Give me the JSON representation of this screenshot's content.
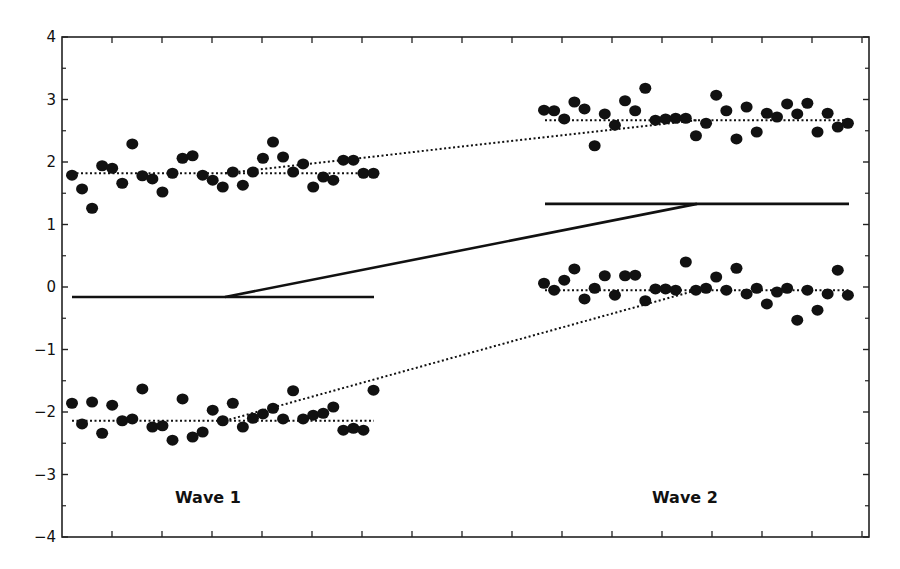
{
  "chart_data": {
    "type": "scatter",
    "title": "",
    "xlabel": "",
    "ylabel": "",
    "ylim": [
      -4,
      4
    ],
    "yticks": [
      4,
      3,
      2,
      1,
      0,
      -1,
      -2,
      -3,
      -4
    ],
    "ytick_labels": [
      "4",
      "3",
      "2",
      "1",
      "0",
      "−1",
      "−2",
      "−3",
      "−4"
    ],
    "grid": false,
    "legend": null,
    "annotations": [
      {
        "text": "Wave 1",
        "position": "bottom-left"
      },
      {
        "text": "Wave 2",
        "position": "bottom-right"
      }
    ],
    "groups": [
      {
        "name": "Wave 1",
        "series": [
          {
            "name": "upper",
            "marker": "circle",
            "values": [
              1.79,
              1.57,
              1.26,
              1.94,
              1.9,
              1.66,
              2.29,
              1.78,
              1.73,
              1.52,
              1.82,
              2.06,
              2.1,
              1.79,
              1.71,
              1.6,
              1.84,
              1.63,
              1.84,
              2.06,
              2.32,
              2.08,
              1.84,
              1.97,
              1.6,
              1.76,
              1.71,
              2.03,
              2.03,
              1.82,
              1.82
            ],
            "mean_line": 1.82
          },
          {
            "name": "lower",
            "marker": "circle",
            "values": [
              -1.86,
              -2.19,
              -1.84,
              -2.34,
              -1.89,
              -2.14,
              -2.11,
              -1.63,
              -2.24,
              -2.22,
              -2.45,
              -1.79,
              -2.4,
              -2.32,
              -1.97,
              -2.14,
              -1.86,
              -2.24,
              -2.1,
              -2.03,
              -1.94,
              -2.11,
              -1.66,
              -2.11,
              -2.05,
              -2.02,
              -1.92,
              -2.29,
              -2.26,
              -2.29,
              -1.65
            ],
            "mean_line": -2.14
          },
          {
            "name": "baseline",
            "marker": "none",
            "line": "solid",
            "value": -0.16
          }
        ]
      },
      {
        "name": "Wave 2",
        "series": [
          {
            "name": "upper",
            "marker": "circle",
            "values": [
              2.83,
              2.82,
              2.69,
              2.96,
              2.85,
              2.26,
              2.77,
              2.59,
              2.98,
              2.82,
              3.18,
              2.67,
              2.69,
              2.7,
              2.7,
              2.42,
              2.62,
              3.07,
              2.82,
              2.37,
              2.88,
              2.48,
              2.78,
              2.72,
              2.93,
              2.77,
              2.94,
              2.48,
              2.78,
              2.56,
              2.62
            ],
            "mean_line": 2.67
          },
          {
            "name": "lower",
            "marker": "circle",
            "values": [
              0.06,
              -0.05,
              0.11,
              0.29,
              -0.19,
              -0.02,
              0.18,
              -0.13,
              0.18,
              0.19,
              -0.22,
              -0.03,
              -0.03,
              -0.05,
              0.4,
              -0.05,
              -0.02,
              0.16,
              -0.05,
              0.3,
              -0.11,
              -0.02,
              -0.27,
              -0.08,
              -0.02,
              -0.53,
              -0.05,
              -0.37,
              -0.11,
              0.27,
              -0.13
            ],
            "mean_line": -0.05
          },
          {
            "name": "baseline",
            "marker": "none",
            "line": "solid",
            "value": 1.33
          }
        ]
      }
    ],
    "connectors": [
      {
        "style": "dotted",
        "from": {
          "group": "Wave 1",
          "value": 1.82
        },
        "to": {
          "group": "Wave 2",
          "value": 2.67
        }
      },
      {
        "style": "dotted",
        "from": {
          "group": "Wave 1",
          "value": -2.14
        },
        "to": {
          "group": "Wave 2",
          "value": -0.05
        }
      },
      {
        "style": "solid",
        "from": {
          "group": "Wave 1",
          "value": -0.16
        },
        "to": {
          "group": "Wave 2",
          "value": 1.33
        }
      }
    ]
  },
  "labels": {
    "wave1": "Wave 1",
    "wave2": "Wave 2"
  },
  "colors": {
    "points": "#111111",
    "lines": "#111111",
    "axis": "#222222"
  }
}
